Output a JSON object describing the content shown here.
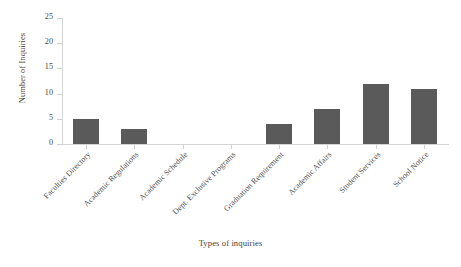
{
  "chart_data": {
    "type": "bar",
    "title": "",
    "subtitle": "",
    "xlabel": "Types of inquiries",
    "ylabel": "Number of Inquiries",
    "categories": [
      "Faculties Directory",
      "Academic Regulations",
      "Academic Schedule",
      "Dept. Exclusive Programs",
      "Graduation Requirement",
      "Academic Affairs",
      "Student Services",
      "School Notice"
    ],
    "values": [
      5,
      3,
      0,
      0,
      4,
      7,
      12,
      11
    ],
    "ylim": [
      0,
      25
    ],
    "yticks": [
      0,
      5,
      10,
      15,
      20,
      25
    ],
    "ytick_labels": [
      "0",
      "5",
      "10",
      "15",
      "20",
      "25"
    ],
    "grid": false,
    "legend": null,
    "bar_color": "#5a5a5a",
    "axis_color": "#d4d4d4",
    "background_color": "#ffffff"
  }
}
